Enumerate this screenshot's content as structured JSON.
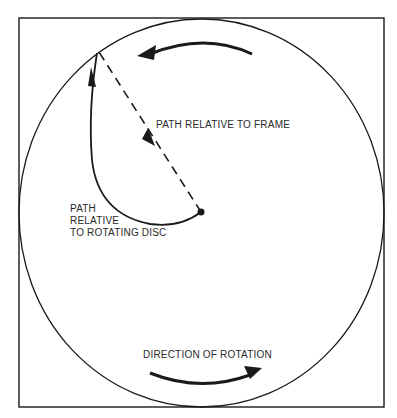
{
  "diagram": {
    "type": "rotating-disc-path",
    "labels": {
      "frame_path": "PATH RELATIVE TO FRAME",
      "disc_path_line1": "PATH",
      "disc_path_line2": "RELATIVE",
      "disc_path_line3": "TO ROTATING DISC",
      "rotation": "DIRECTION OF ROTATION"
    },
    "colors": {
      "stroke": "#1a1a1a",
      "background": "#ffffff"
    }
  }
}
